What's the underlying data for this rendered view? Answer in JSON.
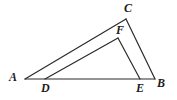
{
  "figure": {
    "name": "triangle-abc-with-inner-triangle-def",
    "background_color": "#ffffff",
    "stroke_color": "#2b2b2b",
    "stroke_width": 1.2,
    "label_color": "#1c1c1c",
    "width": 177,
    "height": 100,
    "points": {
      "A": {
        "x": 25,
        "y": 79
      },
      "B": {
        "x": 155,
        "y": 79
      },
      "C": {
        "x": 126,
        "y": 19
      },
      "D": {
        "x": 45,
        "y": 79
      },
      "E": {
        "x": 140,
        "y": 79
      },
      "F": {
        "x": 118,
        "y": 38
      }
    },
    "segments": [
      {
        "name": "segment-AB",
        "from": "A",
        "to": "B"
      },
      {
        "name": "segment-AC",
        "from": "A",
        "to": "C"
      },
      {
        "name": "segment-CB",
        "from": "C",
        "to": "B"
      },
      {
        "name": "segment-DF",
        "from": "D",
        "to": "F"
      },
      {
        "name": "segment-FE",
        "from": "F",
        "to": "E"
      }
    ],
    "labels": [
      {
        "name": "vertex-label-a",
        "text": "A",
        "x": 9,
        "y": 71
      },
      {
        "name": "vertex-label-b",
        "text": "B",
        "x": 157,
        "y": 77
      },
      {
        "name": "vertex-label-c",
        "text": "C",
        "x": 124,
        "y": 2
      },
      {
        "name": "vertex-label-d",
        "text": "D",
        "x": 41,
        "y": 82
      },
      {
        "name": "vertex-label-e",
        "text": "E",
        "x": 136,
        "y": 82
      },
      {
        "name": "vertex-label-f",
        "text": "F",
        "x": 116,
        "y": 24
      }
    ]
  }
}
